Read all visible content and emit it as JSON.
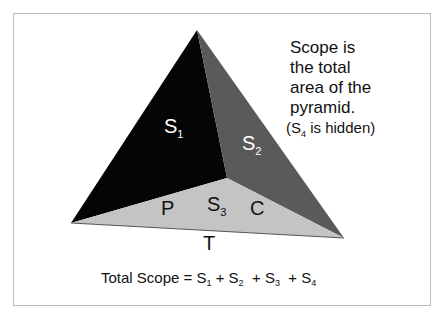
{
  "diagram": {
    "type": "pyramid",
    "colors": {
      "face_s1": "#050505",
      "face_s2": "#5a5a5a",
      "face_s3": "#c4c4c4",
      "frame": "#bdbdbd",
      "label_light": "#ffffff",
      "label_dark": "#111111"
    },
    "faces": {
      "s1": {
        "letter": "S",
        "sub": "1"
      },
      "s2": {
        "letter": "S",
        "sub": "2"
      },
      "s3": {
        "letter": "S",
        "sub": "3"
      }
    },
    "edge_labels": {
      "p": "P",
      "c": "C",
      "t": "T"
    },
    "note": {
      "lines": [
        "Scope is",
        "the total",
        "area of the",
        "pyramid."
      ],
      "hidden_open": "(S",
      "hidden_sub": "4",
      "hidden_close": " is hidden)"
    },
    "formula": {
      "prefix": "Total Scope = S",
      "sub1": "1",
      "plus2": " + S",
      "sub2": "2",
      "plus3": "  + S",
      "sub3": "3",
      "plus4": "  + S",
      "sub4": "4"
    }
  }
}
